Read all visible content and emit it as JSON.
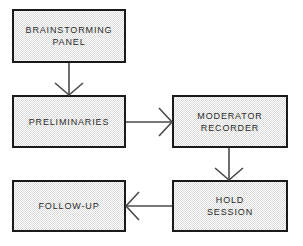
{
  "diagram": {
    "type": "flowchart",
    "canvas": {
      "width": 303,
      "height": 246,
      "background": "#ffffff"
    },
    "style": {
      "node_fill": "#dadada",
      "node_fill_pattern": "checkerboard-dither",
      "node_border": "#1a1a1a",
      "connector_color": "#4a4a4a",
      "text_color": "#2a2a2a",
      "arrowhead": "open-v"
    },
    "nodes": [
      {
        "id": "brainstorming-panel",
        "label": "BRAINSTORMING\nPANEL",
        "lines": [
          "BRAINSTORMING",
          "PANEL"
        ],
        "x": 12,
        "y": 9,
        "width": 114,
        "height": 54
      },
      {
        "id": "preliminaries",
        "label": "PRELIMINARIES",
        "lines": [
          "PRELIMINARIES"
        ],
        "x": 12,
        "y": 95,
        "width": 114,
        "height": 53
      },
      {
        "id": "moderator-recorder",
        "label": "MODERATOR\nRECORDER",
        "lines": [
          "MODERATOR",
          "RECORDER"
        ],
        "x": 172,
        "y": 95,
        "width": 116,
        "height": 53
      },
      {
        "id": "hold-session",
        "label": "HOLD\nSESSION",
        "lines": [
          "HOLD",
          "SESSION"
        ],
        "x": 172,
        "y": 180,
        "width": 116,
        "height": 52
      },
      {
        "id": "follow-up",
        "label": "FOLLOW-UP",
        "lines": [
          "FOLLOW-UP"
        ],
        "x": 12,
        "y": 180,
        "width": 114,
        "height": 52
      }
    ],
    "edges": [
      {
        "id": "edge-panel-to-preliminaries",
        "from": "brainstorming-panel",
        "to": "preliminaries",
        "direction": "down"
      },
      {
        "id": "edge-preliminaries-to-moderator",
        "from": "preliminaries",
        "to": "moderator-recorder",
        "direction": "right"
      },
      {
        "id": "edge-moderator-to-hold-session",
        "from": "moderator-recorder",
        "to": "hold-session",
        "direction": "down"
      },
      {
        "id": "edge-hold-session-to-follow-up",
        "from": "hold-session",
        "to": "follow-up",
        "direction": "left"
      }
    ]
  }
}
